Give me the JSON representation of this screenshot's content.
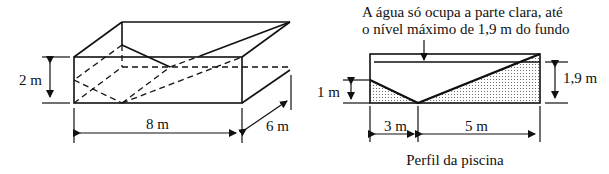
{
  "figure": {
    "pool_3d": {
      "height_label": "2 m",
      "length_label": "8 m",
      "width_label": "6 m"
    },
    "profile": {
      "note_line1": "A água só ocupa a parte clara, até",
      "note_line2": "o nível máximo de 1,9 m do fundo",
      "left_height_label": "1 m",
      "right_height_label": "1,9 m",
      "left_segment_label": "3 m",
      "right_segment_label": "5 m",
      "caption": "Perfil da piscina"
    },
    "colors": {
      "line": "#111111",
      "background": "#ffffff",
      "dots": "#555555"
    }
  }
}
